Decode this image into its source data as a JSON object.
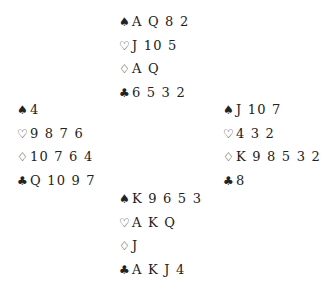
{
  "hands": {
    "north": {
      "spades": "A Q 8 2",
      "hearts": "J 10 5",
      "diamonds": "A Q",
      "clubs": "6 5 3 2"
    },
    "west": {
      "spades": "4",
      "hearts": "9 8 7 6",
      "diamonds": "10 7 6 4",
      "clubs": "Q 10 9 7"
    },
    "east": {
      "spades": "J 10 7",
      "hearts": "4 3 2",
      "diamonds": "K 9 8 5 3 2",
      "clubs": "8"
    },
    "south": {
      "spades": "K 9 6 5 3",
      "hearts": "A K Q",
      "diamonds": "J",
      "clubs": "A K J 4"
    }
  },
  "suits": {
    "spades": "♠",
    "hearts": "♡",
    "diamonds": "♢",
    "clubs": "♣"
  }
}
